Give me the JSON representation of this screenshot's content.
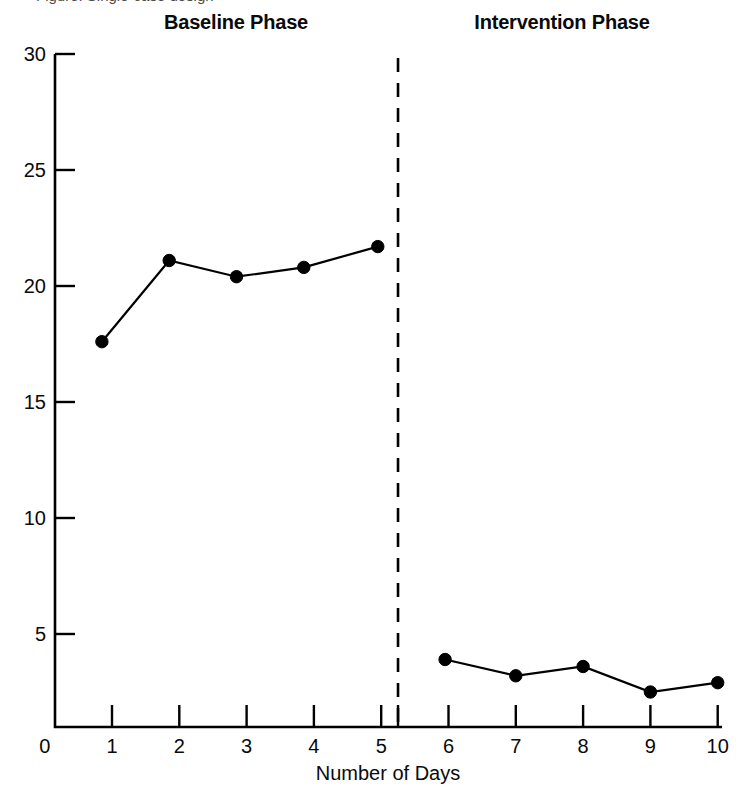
{
  "figure": {
    "clipped_header_text": "Figure: Single-case design",
    "phase_labels": {
      "baseline": "Baseline Phase",
      "intervention": "Intervention Phase"
    }
  },
  "chart_data": {
    "type": "line",
    "title": "",
    "subtitle": "",
    "xlabel": "Number of Days",
    "ylabel": "",
    "xlim": [
      0,
      10
    ],
    "ylim": [
      0,
      30
    ],
    "xticks": [
      "0",
      "1",
      "2",
      "3",
      "4",
      "5",
      "6",
      "7",
      "8",
      "9",
      "10"
    ],
    "yticks": [
      "0",
      "5",
      "10",
      "15",
      "20",
      "25",
      "30"
    ],
    "grid": false,
    "legend": null,
    "marker": "filled-circle",
    "line_color": "#000000",
    "marker_color": "#000000",
    "phase_divider": {
      "x": 5.25,
      "style": "dashed",
      "color": "#000000",
      "extra_tick": true
    },
    "series": [
      {
        "name": "Baseline Phase",
        "x": [
          0.85,
          1.85,
          2.85,
          3.85,
          4.95
        ],
        "values": [
          17.6,
          21.1,
          20.4,
          20.8,
          21.7
        ]
      },
      {
        "name": "Intervention Phase",
        "x": [
          5.95,
          7.0,
          8.0,
          9.0,
          10.0
        ],
        "values": [
          3.9,
          3.2,
          3.6,
          2.5,
          2.9
        ]
      }
    ]
  }
}
